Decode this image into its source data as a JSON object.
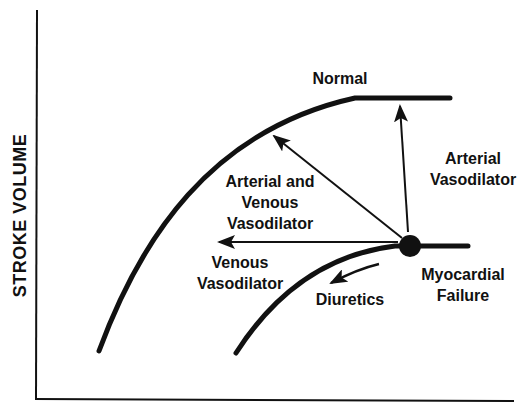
{
  "diagram": {
    "y_axis_label": "STROKE VOLUME",
    "x_axis_label": "",
    "curves": [
      {
        "name": "normal-curve",
        "label": "Normal"
      },
      {
        "name": "myocardial-failure-curve",
        "label": "Myocardial Failure",
        "label_lines": [
          "Myocardial",
          "Failure"
        ]
      }
    ],
    "operating_point": {
      "label": "Myocardial Failure"
    },
    "arrows": [
      {
        "name": "arterial-and-venous-vasodilator-arrow",
        "label_lines": [
          "Arterial and",
          "Venous",
          "Vasodilator"
        ],
        "direction": "up-left"
      },
      {
        "name": "arterial-vasodilator-arrow",
        "label_lines": [
          "Arterial",
          "Vasodilator"
        ],
        "direction": "up"
      },
      {
        "name": "venous-vasodilator-arrow",
        "label_lines": [
          "Venous",
          "Vasodilator"
        ],
        "direction": "left"
      },
      {
        "name": "diuretics-arrow",
        "label_lines": [
          "Diuretics"
        ],
        "direction": "down-left-along-curve"
      }
    ],
    "colors": {
      "ink": "#111111",
      "background": "#ffffff"
    }
  }
}
